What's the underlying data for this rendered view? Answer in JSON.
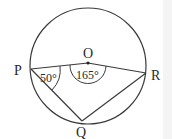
{
  "diagram": {
    "type": "circle-geometry",
    "circle": {
      "center_label": "O"
    },
    "points": [
      {
        "id": "P",
        "label": "P"
      },
      {
        "id": "Q",
        "label": "Q"
      },
      {
        "id": "R",
        "label": "R"
      },
      {
        "id": "O",
        "label": "O"
      }
    ],
    "angles": [
      {
        "vertex": "P",
        "label": "50°"
      },
      {
        "vertex": "O",
        "label": "165°"
      }
    ],
    "segments": [
      "PO",
      "OR",
      "PQ",
      "QR"
    ],
    "stroke_color": "#3a3a3a"
  }
}
